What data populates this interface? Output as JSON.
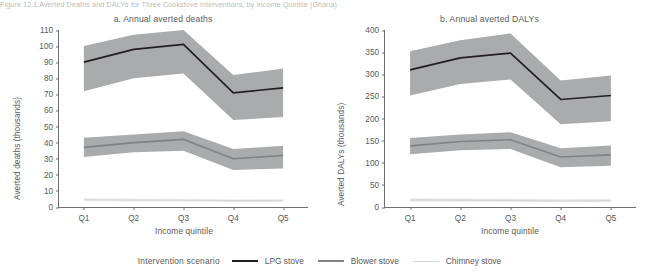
{
  "figure": {
    "header": "Figure 12.1  Averted Deaths and DALYs for Three Cookstove Interventions, by Income Quintile (Ghana)",
    "xlabel": "Income quintile",
    "legend_title": "Intervention scenario"
  },
  "legend": {
    "items": [
      {
        "label": "LPG stove",
        "color": "#231f20",
        "key": "lpg"
      },
      {
        "label": "Blower stove",
        "color": "#808285",
        "key": "blower"
      },
      {
        "label": "Chimney stove",
        "color": "#d4d6d8",
        "key": "chimney"
      }
    ]
  },
  "chart_data": [
    {
      "type": "line",
      "title": "a. Annual averted deaths",
      "xlabel": "Income quintile",
      "ylabel": "Averted deaths (thousands)",
      "categories": [
        "Q1",
        "Q2",
        "Q3",
        "Q4",
        "Q5"
      ],
      "ylim": [
        0,
        110
      ],
      "yticks": [
        0,
        10,
        20,
        30,
        40,
        50,
        60,
        70,
        80,
        90,
        100,
        110
      ],
      "grid": false,
      "legend_position": "bottom",
      "series": [
        {
          "name": "LPG stove",
          "color": "#231f20",
          "values": [
            90,
            98,
            101,
            71,
            74
          ],
          "band_low": [
            72,
            80,
            83,
            54,
            56
          ],
          "band_high": [
            100,
            107,
            110,
            82,
            86
          ]
        },
        {
          "name": "Blower stove",
          "color": "#808285",
          "values": [
            37,
            40,
            42,
            30,
            32
          ],
          "band_low": [
            31,
            34,
            35,
            23,
            24
          ],
          "band_high": [
            43,
            45,
            47,
            36,
            38
          ]
        },
        {
          "name": "Chimney stove",
          "color": "#d4d6d8",
          "values": [
            4.5,
            4.3,
            4.2,
            3.9,
            4.0
          ],
          "band_low": [
            3.6,
            3.5,
            3.4,
            3.1,
            3.2
          ],
          "band_high": [
            5.4,
            5.2,
            5.0,
            4.7,
            4.8
          ]
        }
      ]
    },
    {
      "type": "line",
      "title": "b. Annual averted DALYs",
      "xlabel": "Income quintile",
      "ylabel": "Averted DALYs (thousands)",
      "categories": [
        "Q1",
        "Q2",
        "Q3",
        "Q4",
        "Q5"
      ],
      "ylim": [
        0,
        400
      ],
      "yticks": [
        0,
        50,
        100,
        150,
        200,
        250,
        300,
        350,
        400
      ],
      "grid": false,
      "legend_position": "bottom",
      "series": [
        {
          "name": "LPG stove",
          "color": "#231f20",
          "values": [
            310,
            337,
            348,
            243,
            252
          ],
          "band_low": [
            252,
            278,
            288,
            187,
            194
          ],
          "band_high": [
            352,
            377,
            392,
            286,
            297
          ]
        },
        {
          "name": "Blower stove",
          "color": "#808285",
          "values": [
            138,
            148,
            152,
            113,
            118
          ],
          "band_low": [
            119,
            128,
            131,
            90,
            93
          ],
          "band_high": [
            156,
            164,
            169,
            133,
            139
          ]
        },
        {
          "name": "Chimney stove",
          "color": "#d4d6d8",
          "values": [
            16,
            15.5,
            15,
            14,
            14.5
          ],
          "band_low": [
            12,
            12,
            11.5,
            11,
            11
          ],
          "band_high": [
            20,
            19,
            18.5,
            17.5,
            18
          ]
        }
      ]
    }
  ]
}
